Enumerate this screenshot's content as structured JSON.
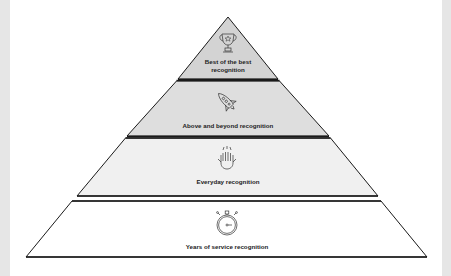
{
  "diagram": {
    "type": "pyramid",
    "tiers": [
      {
        "level": 1,
        "position": "top",
        "label_line1": "Best of the best",
        "label_line2": "recognition",
        "icon": "trophy-icon",
        "fill": "#d3d3d3"
      },
      {
        "level": 2,
        "position": "upper-middle",
        "label": "Above and beyond recognition",
        "icon": "rocket-icon",
        "fill": "#dedede"
      },
      {
        "level": 3,
        "position": "lower-middle",
        "label": "Everyday recognition",
        "icon": "high-five-icon",
        "fill": "#f0f0f0"
      },
      {
        "level": 4,
        "position": "bottom",
        "label": "Years of service recognition",
        "icon": "stopwatch-icon",
        "fill": "#ffffff"
      }
    ],
    "stroke_color": "#1a1a1a",
    "side_border_color": "#e6e6e6"
  }
}
